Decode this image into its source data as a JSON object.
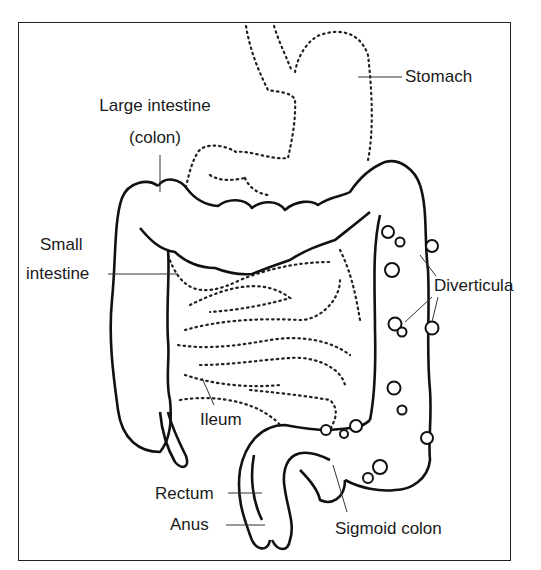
{
  "diagram": {
    "labels": {
      "stomach": "Stomach",
      "large_intestine_line1": "Large intestine",
      "large_intestine_line2": "(colon)",
      "small_intestine_line1": "Small",
      "small_intestine_line2": "intestine",
      "diverticula": "Diverticula",
      "ileum": "Ileum",
      "rectum": "Rectum",
      "anus": "Anus",
      "sigmoid_colon": "Sigmoid colon"
    },
    "colors": {
      "ink": "#1a1a1a",
      "background": "#ffffff"
    }
  }
}
